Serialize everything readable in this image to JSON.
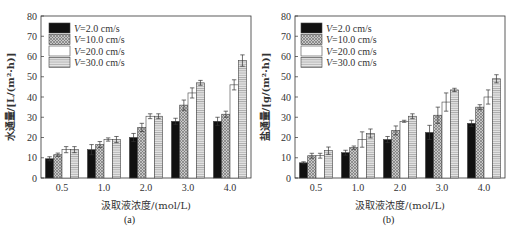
{
  "series_labels": [
    "V=2.0 cm/s",
    "V=10.0 cm/s",
    "V=20.0 cm/s",
    "V=30.0 cm/s"
  ],
  "series_styles": [
    {
      "fill": "#111111",
      "pattern": "solid"
    },
    {
      "fill": "#b8b8b8",
      "pattern": "crosshatch"
    },
    {
      "fill": "#ffffff",
      "pattern": "solid"
    },
    {
      "fill": "#d4d4d4",
      "pattern": "hlines"
    }
  ],
  "chart_data": [
    {
      "id": "a",
      "type": "bar",
      "caption": "(a)",
      "title": "",
      "xlabel": "汲取液浓度/(mol/L)",
      "ylabel": "水通量/[L/(m²·h)]",
      "categories": [
        "0.5",
        "1.0",
        "2.0",
        "3.0",
        "4.0"
      ],
      "ylim": [
        0,
        80
      ],
      "yticks": [
        0,
        10,
        20,
        30,
        40,
        50,
        60,
        70,
        80
      ],
      "grid": false,
      "legend_position": "upper left",
      "series": [
        {
          "name": "V=2.0 cm/s",
          "values": [
            9.5,
            14,
            20,
            28,
            28
          ],
          "errors": [
            1,
            2.5,
            2,
            1.5,
            2
          ]
        },
        {
          "name": "V=10.0 cm/s",
          "values": [
            11.5,
            16.5,
            25,
            36,
            31.5
          ],
          "errors": [
            0.8,
            1.5,
            2,
            2.5,
            1.5
          ]
        },
        {
          "name": "V=20.0 cm/s",
          "values": [
            14,
            19,
            30.5,
            42,
            46
          ],
          "errors": [
            1.5,
            0.8,
            1.2,
            2.5,
            2.5
          ]
        },
        {
          "name": "V=30.0 cm/s",
          "values": [
            14,
            19,
            30.5,
            47,
            58
          ],
          "errors": [
            1.5,
            1.5,
            1.2,
            1.2,
            2.8
          ]
        }
      ]
    },
    {
      "id": "b",
      "type": "bar",
      "caption": "(b)",
      "title": "",
      "xlabel": "汲取液浓度/(mol/L)",
      "ylabel": "盐通量/[g/(m²·h)]",
      "categories": [
        "0.5",
        "1.0",
        "2.0",
        "3.0",
        "4.0"
      ],
      "ylim": [
        0,
        80
      ],
      "yticks": [
        0,
        10,
        20,
        30,
        40,
        50,
        60,
        70,
        80
      ],
      "grid": false,
      "legend_position": "upper left",
      "series": [
        {
          "name": "V=2.0 cm/s",
          "values": [
            7.5,
            12.5,
            19,
            22.5,
            27
          ],
          "errors": [
            0.5,
            1.2,
            1.5,
            3.5,
            1.5
          ]
        },
        {
          "name": "V=10.0 cm/s",
          "values": [
            11,
            15,
            23.5,
            31,
            35
          ],
          "errors": [
            1.2,
            0.8,
            2.2,
            4,
            1.2
          ]
        },
        {
          "name": "V=20.0 cm/s",
          "values": [
            11,
            19,
            28,
            37.5,
            40
          ],
          "errors": [
            1.2,
            3.8,
            0.5,
            4.5,
            3.5
          ]
        },
        {
          "name": "V=30.0 cm/s",
          "values": [
            13.5,
            22,
            30.5,
            43.5,
            49
          ],
          "errors": [
            1.8,
            2.2,
            1.2,
            0.8,
            2
          ]
        }
      ]
    }
  ]
}
